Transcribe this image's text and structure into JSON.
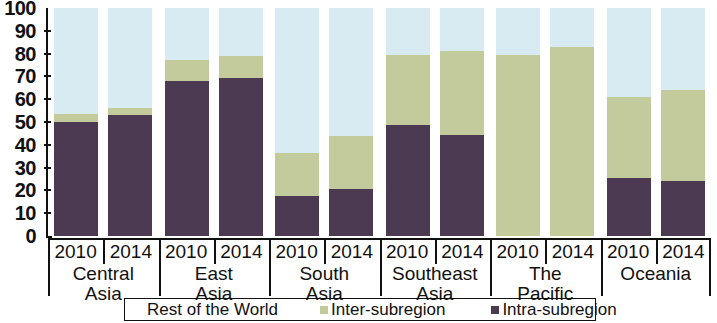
{
  "chart_data": {
    "type": "bar",
    "subtype": "stacked-column-100",
    "title": "",
    "xlabel": "",
    "ylabel": "",
    "ylim": [
      0,
      100
    ],
    "ytick_labels": [
      "0",
      "10",
      "20",
      "30",
      "40",
      "50",
      "60",
      "70",
      "80",
      "90",
      "100"
    ],
    "ytick_values": [
      0,
      10,
      20,
      30,
      40,
      50,
      60,
      70,
      80,
      90,
      100
    ],
    "grid": false,
    "legend_position": "bottom",
    "categories": [
      "Central Asia 2010",
      "Central Asia 2014",
      "East Asia 2010",
      "East Asia 2014",
      "South Asia 2010",
      "South Asia 2014",
      "Southeast Asia 2010",
      "Southeast Asia 2014",
      "The Pacific 2010",
      "The Pacific 2014",
      "Oceania 2010",
      "Oceania 2014"
    ],
    "series": [
      {
        "name": "Intra-subregion",
        "color": "#4c3a52",
        "values": [
          50,
          53,
          68,
          69.5,
          17.5,
          20.5,
          48.5,
          44.5,
          0,
          0,
          25.5,
          24
        ]
      },
      {
        "name": "Inter-subregion",
        "color": "#c3cb9c",
        "values": [
          3.5,
          3,
          9,
          9.5,
          19,
          23.5,
          31,
          36.5,
          79.5,
          83,
          35.5,
          40
        ]
      },
      {
        "name": "Rest of the World",
        "color": "#d8eaf2",
        "values": [
          46.5,
          44,
          23,
          21,
          63.5,
          56,
          20.5,
          19,
          20.5,
          17,
          39,
          36
        ]
      }
    ],
    "cumulative_tops": {
      "intra": [
        50,
        53,
        68,
        69.5,
        17.5,
        20.5,
        48.5,
        44.5,
        0,
        0,
        25.5,
        24
      ],
      "inter": [
        53.5,
        56,
        77,
        79,
        36.5,
        44,
        79.5,
        81,
        79.5,
        83,
        61,
        64
      ]
    }
  },
  "y_axis": {
    "ticks": [
      "100",
      "90",
      "80",
      "70",
      "60",
      "50",
      "40",
      "30",
      "20",
      "10",
      "0"
    ]
  },
  "x_axis": {
    "groups": [
      {
        "region_line1": "Central",
        "region_line2": "Asia",
        "years": [
          "2010",
          "2014"
        ]
      },
      {
        "region_line1": "East",
        "region_line2": "Asia",
        "years": [
          "2010",
          "2014"
        ]
      },
      {
        "region_line1": "South",
        "region_line2": "Asia",
        "years": [
          "2010",
          "2014"
        ]
      },
      {
        "region_line1": "Southeast",
        "region_line2": "Asia",
        "years": [
          "2010",
          "2014"
        ]
      },
      {
        "region_line1": "The",
        "region_line2": "Pacific",
        "years": [
          "2010",
          "2014"
        ]
      },
      {
        "region_line1": "Oceania",
        "region_line2": "",
        "years": [
          "2010",
          "2014"
        ]
      }
    ]
  },
  "legend": {
    "items": [
      {
        "label": "Rest of the World",
        "color": "#d8eaf2",
        "show_swatch": false
      },
      {
        "label": "Inter-subregion",
        "color": "#c3cb9c",
        "show_swatch": true
      },
      {
        "label": "Intra-subregion",
        "color": "#4c3a52",
        "show_swatch": true
      }
    ]
  },
  "colors": {
    "intra_subregion": "#4c3a52",
    "inter_subregion": "#c3cb9c",
    "rest_of_world": "#d8eaf2",
    "axis": "#111111",
    "background": "#ffffff"
  }
}
